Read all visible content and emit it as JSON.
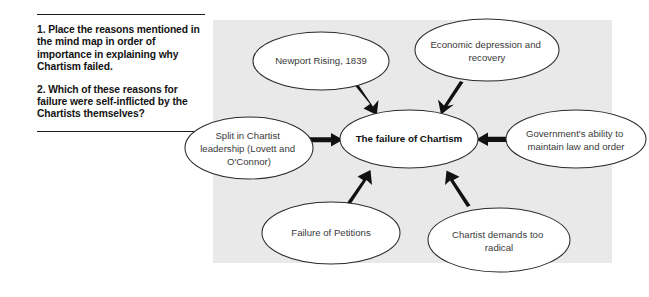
{
  "page": {
    "background_color": "#ffffff",
    "panel_color": "#e9e9e9"
  },
  "questions": {
    "items": [
      "1. Place the reasons mentioned in the mind map in order of importance in explaining why Chartism failed.",
      "2. Which of these reasons for failure were self-inflicted by the Chartists themselves?"
    ]
  },
  "mindmap": {
    "center": {
      "label": "The failure of Chartism"
    },
    "nodes": [
      {
        "id": "newport",
        "label": "Newport Rising, 1839"
      },
      {
        "id": "economic",
        "label": "Economic depression and recovery"
      },
      {
        "id": "split",
        "label": "Split in Chartist leadership (Lovett and O'Connor)"
      },
      {
        "id": "government",
        "label": "Government's ability to maintain law and order"
      },
      {
        "id": "petitions",
        "label": "Failure of Petitions"
      },
      {
        "id": "radical",
        "label": "Chartist demands too radical"
      }
    ],
    "edges": [
      {
        "from": "newport",
        "to": "center",
        "direction": "down-right"
      },
      {
        "from": "economic",
        "to": "center",
        "direction": "down-left"
      },
      {
        "from": "split",
        "to": "center",
        "direction": "right"
      },
      {
        "from": "government",
        "to": "center",
        "direction": "left"
      },
      {
        "from": "petitions",
        "to": "center",
        "direction": "up-right"
      },
      {
        "from": "radical",
        "to": "center",
        "direction": "up-left"
      }
    ]
  }
}
